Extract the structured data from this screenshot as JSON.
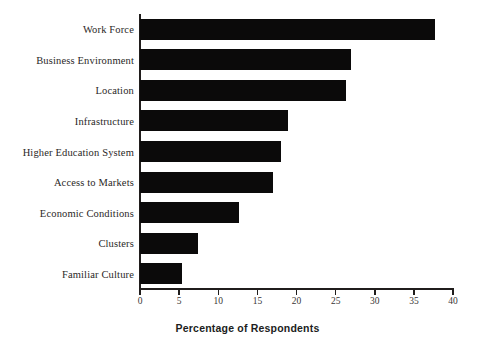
{
  "chart_data": {
    "type": "bar",
    "orientation": "horizontal",
    "title": "",
    "xlabel": "Percentage of Respondents",
    "ylabel": "",
    "xlim": [
      0,
      40
    ],
    "xticks": [
      0,
      5,
      10,
      15,
      20,
      25,
      30,
      35,
      40
    ],
    "grid": false,
    "legend": null,
    "bar_color": "#0b0a0a",
    "axis_color": "#201d1c",
    "background": "#ffffff",
    "categories": [
      "Work Force",
      "Business Environment",
      "Location",
      "Infrastructure",
      "Higher Education System",
      "Access to Markets",
      "Economic Conditions",
      "Clusters",
      "Familiar Culture"
    ],
    "values": [
      37.7,
      27.0,
      26.3,
      18.9,
      18.0,
      17.0,
      12.6,
      7.4,
      5.4
    ]
  }
}
